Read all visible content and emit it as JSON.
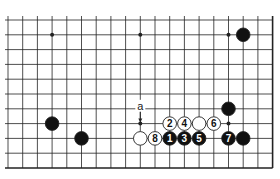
{
  "diagram": {
    "type": "go-board-partial",
    "grid": {
      "cols": 19,
      "rows": 11,
      "x0": 8,
      "dx": 14.7,
      "y0": 20,
      "dy": 14.8,
      "right_edge": true,
      "bottom_edge": true
    },
    "star_points": [
      [
        3,
        1
      ],
      [
        9,
        1
      ],
      [
        15,
        1
      ],
      [
        15,
        7
      ],
      [
        9,
        7
      ]
    ],
    "stones": [
      {
        "col": 16,
        "row": 1,
        "color": "black",
        "label": ""
      },
      {
        "col": 3,
        "row": 7,
        "color": "black",
        "label": ""
      },
      {
        "col": 5,
        "row": 8,
        "color": "black",
        "label": ""
      },
      {
        "col": 15,
        "row": 6,
        "color": "black",
        "label": ""
      },
      {
        "col": 9,
        "row": 8,
        "color": "white",
        "label": ""
      },
      {
        "col": 10,
        "row": 8,
        "color": "white",
        "label": "8"
      },
      {
        "col": 11,
        "row": 8,
        "color": "black",
        "label": "1"
      },
      {
        "col": 12,
        "row": 8,
        "color": "black",
        "label": "3"
      },
      {
        "col": 13,
        "row": 8,
        "color": "black",
        "label": "5"
      },
      {
        "col": 15,
        "row": 8,
        "color": "black",
        "label": "7"
      },
      {
        "col": 16,
        "row": 8,
        "color": "black",
        "label": ""
      },
      {
        "col": 11,
        "row": 7,
        "color": "white",
        "label": "2"
      },
      {
        "col": 12,
        "row": 7,
        "color": "white",
        "label": "4"
      },
      {
        "col": 13,
        "row": 7,
        "color": "white",
        "label": ""
      },
      {
        "col": 14,
        "row": 7,
        "color": "white",
        "label": "6"
      }
    ],
    "annotations": [
      {
        "col": 9,
        "row": 6,
        "text": "a",
        "arrow_to": [
          9,
          7
        ]
      }
    ],
    "colors": {
      "line": "#222222",
      "black": "#111111",
      "white": "#ffffff",
      "background": "#ffffff"
    }
  }
}
